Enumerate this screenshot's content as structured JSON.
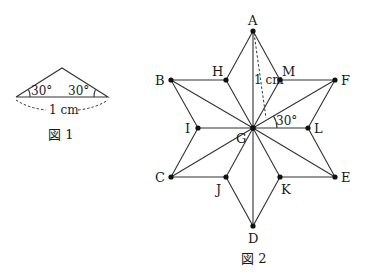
{
  "figure1": {
    "caption": "図 1",
    "angle_left": "30°",
    "angle_right": "30°",
    "base_length": "1 cm",
    "apex": [
      62,
      68
    ],
    "base_left": [
      16,
      97
    ],
    "base_right": [
      108,
      97
    ]
  },
  "figure2": {
    "caption": "図 2",
    "length_label": "1 cm",
    "angle_label": "30°",
    "points": {
      "A": {
        "label": "A",
        "xy": [
          253,
          31
        ]
      },
      "B": {
        "label": "B",
        "xy": [
          171,
          80
        ]
      },
      "H": {
        "label": "H",
        "xy": [
          226,
          80
        ]
      },
      "M": {
        "label": "M",
        "xy": [
          280,
          80
        ]
      },
      "F": {
        "label": "F",
        "xy": [
          335,
          80
        ]
      },
      "I": {
        "label": "I",
        "xy": [
          198,
          128
        ]
      },
      "G": {
        "label": "G",
        "xy": [
          253,
          128
        ]
      },
      "L": {
        "label": "L",
        "xy": [
          308,
          128
        ]
      },
      "C": {
        "label": "C",
        "xy": [
          171,
          177
        ]
      },
      "J": {
        "label": "J",
        "xy": [
          226,
          177
        ]
      },
      "K": {
        "label": "K",
        "xy": [
          280,
          177
        ]
      },
      "E": {
        "label": "E",
        "xy": [
          335,
          177
        ]
      },
      "D": {
        "label": "D",
        "xy": [
          253,
          226
        ]
      }
    }
  }
}
